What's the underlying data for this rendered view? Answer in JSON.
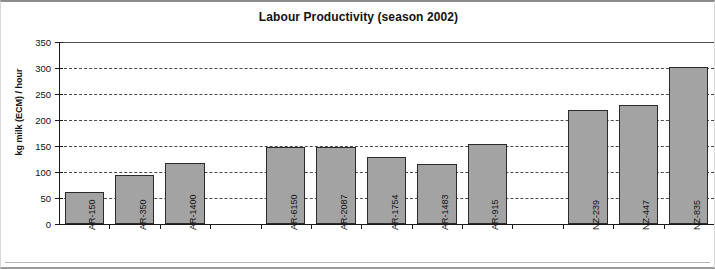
{
  "chart_data": {
    "type": "bar",
    "title": "Labour Productivity (season 2002)",
    "xlabel": "",
    "ylabel": "kg milk (ECM) / hour",
    "ylim": [
      0,
      350
    ],
    "ytick_step": 50,
    "yticks": [
      "350",
      "300",
      "250",
      "200",
      "150",
      "100",
      "50",
      "0"
    ],
    "grid": true,
    "legend": false,
    "categories": [
      "AR-150",
      "AR-350",
      "AR-1400",
      "",
      "AR-6150",
      "AR-2087",
      "AR-1754",
      "AR-1483",
      "AR-915",
      "",
      "NZ-239",
      "NZ-447",
      "NZ-835"
    ],
    "values": [
      62,
      95,
      118,
      null,
      148,
      148,
      128,
      115,
      153,
      null,
      220,
      228,
      302
    ],
    "bar_color": "#a3a3a3",
    "bar_border_color": "#2b2b2b",
    "grid_color": "#4a4a4a",
    "axis_color": "#1a1a1a",
    "text_color": "#121212"
  }
}
